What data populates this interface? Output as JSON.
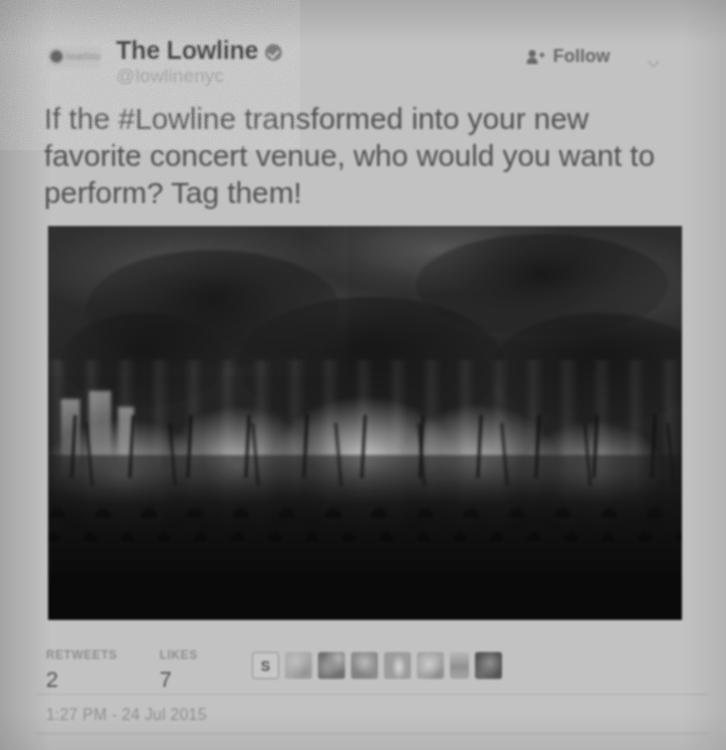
{
  "tweet": {
    "avatar": {
      "icon": "avatar-logo",
      "wordmark": "lowline"
    },
    "display_name": "The Lowline",
    "verified": true,
    "verified_icon": "verified-badge-icon",
    "handle": "@lowlinenyc",
    "follow": {
      "label": "Follow",
      "icon": "person-plus-icon"
    },
    "more_icon": "chevron-down-icon",
    "text": "If the #Lowline transformed into your new favorite concert venue, who would you want to perform? Tag them!",
    "photo": {
      "alt": "concert-crowd-photo",
      "description": "Dark underground venue with stage haze, bright light beams and a silhouetted crowd with raised arms"
    },
    "stats": [
      {
        "label": "RETWEETS",
        "value": "2"
      },
      {
        "label": "LIKES",
        "value": "7"
      }
    ],
    "engagers": [
      {
        "name": "engager-avatar-1",
        "initial": "S"
      },
      {
        "name": "engager-avatar-2",
        "initial": ""
      },
      {
        "name": "engager-avatar-3",
        "initial": ""
      },
      {
        "name": "engager-avatar-4",
        "initial": ""
      },
      {
        "name": "engager-avatar-5",
        "initial": ""
      },
      {
        "name": "engager-avatar-6",
        "initial": ""
      },
      {
        "name": "engager-avatar-7",
        "initial": ""
      },
      {
        "name": "engager-avatar-8",
        "initial": ""
      }
    ],
    "timestamp": "1:27 PM - 24 Jul 2015"
  },
  "colors": {
    "page_background": "#c4c4c4",
    "primary_text": "#4a4a4a",
    "secondary_text": "#8e8e8e",
    "photo_dark": "#0a0a0a"
  }
}
